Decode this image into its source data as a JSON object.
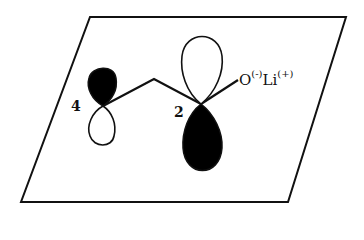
{
  "diagram": {
    "type": "orbital-diagram",
    "labels": {
      "atom_4": "4",
      "atom_2": "2",
      "oxygen": "O",
      "oxygen_charge": "(-)",
      "lithium": "Li",
      "lithium_charge": "(+)"
    },
    "colors": {
      "line": "#111111",
      "filled_lobe": "#000000",
      "empty_lobe": "#ffffff"
    }
  }
}
